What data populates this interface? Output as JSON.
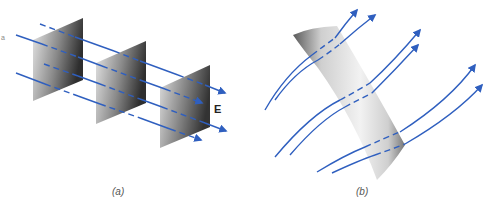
{
  "figure": {
    "panels": [
      {
        "id": "a",
        "caption": "(a)",
        "description": "Uniform electric field lines passing through three parallel flat plates",
        "field_label": "E",
        "plates": 3,
        "field_lines": 4
      },
      {
        "id": "b",
        "caption": "(b)",
        "description": "Curved field lines passing through a curved surface",
        "field_lines": 6
      }
    ],
    "edge_mark": "a",
    "colors": {
      "field_line": "#2f5fbf",
      "plate_dark": "#3a3a3a",
      "plate_light": "#e6e6e6",
      "background": "#ffffff",
      "label": "#222222"
    }
  }
}
